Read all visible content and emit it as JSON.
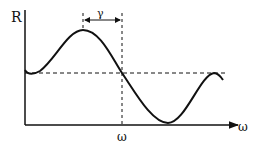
{
  "diagram": {
    "y_axis_label": "R",
    "x_axis_label": "ω",
    "marker_label": "ω",
    "interval_label": "γ",
    "colors": {
      "stroke": "#111111",
      "background": "#ffffff"
    }
  }
}
